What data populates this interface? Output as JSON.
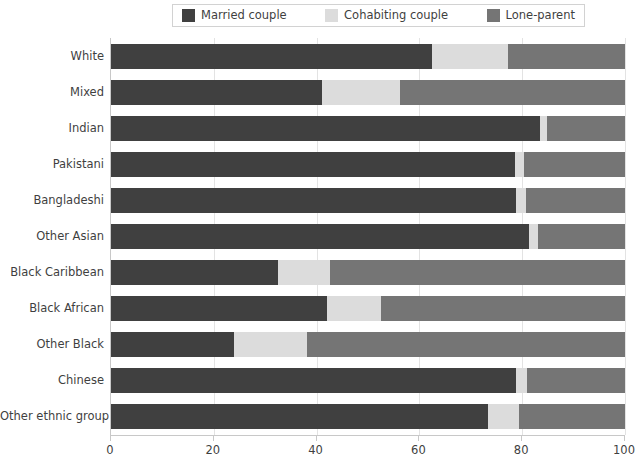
{
  "legend": {
    "position": "top-center",
    "entries": [
      {
        "label": "Married couple",
        "color": "#404040",
        "icon": "legend-swatch-married"
      },
      {
        "label": "Cohabiting couple",
        "color": "#dcdcdc",
        "icon": "legend-swatch-cohabiting"
      },
      {
        "label": "Lone-parent",
        "color": "#757575",
        "icon": "legend-swatch-lone-parent"
      }
    ]
  },
  "axis": {
    "x": {
      "ticks": [
        "0",
        "20",
        "40",
        "60",
        "80",
        "100"
      ],
      "values": [
        0,
        20,
        40,
        60,
        80,
        100
      ],
      "min": 0,
      "max": 100,
      "label": ""
    },
    "y": {
      "label": ""
    }
  },
  "chart_data": {
    "type": "bar",
    "orientation": "horizontal",
    "stacked": true,
    "stack_total": 100,
    "title": "",
    "xlabel": "",
    "ylabel": "",
    "xlim": [
      0,
      100
    ],
    "grid": true,
    "legend_position": "top-center",
    "categories": [
      "White",
      "Mixed",
      "Indian",
      "Pakistani",
      "Bangladeshi",
      "Other Asian",
      "Black Caribbean",
      "Black African",
      "Other Black",
      "Chinese",
      "Other ethnic group"
    ],
    "series": [
      {
        "name": "Married couple",
        "color": "#404040",
        "values": [
          62.5,
          41.0,
          83.5,
          78.6,
          78.8,
          81.3,
          32.5,
          42.0,
          23.9,
          78.8,
          73.3
        ]
      },
      {
        "name": "Cohabiting couple",
        "color": "#dcdcdc",
        "values": [
          14.7,
          15.2,
          1.3,
          1.7,
          1.9,
          1.8,
          10.1,
          10.5,
          14.2,
          2.1,
          6.1
        ]
      },
      {
        "name": "Lone-parent",
        "color": "#757575",
        "values": [
          22.8,
          43.8,
          15.2,
          19.7,
          19.3,
          16.9,
          57.4,
          47.5,
          61.9,
          19.1,
          20.6
        ]
      }
    ]
  },
  "style": {
    "background": "#ffffff",
    "gridline_color": "#e3e3e3",
    "axis_color": "#c8c8c8",
    "text_color": "#3f3f3f",
    "legend_border": "#d2d2d2"
  }
}
